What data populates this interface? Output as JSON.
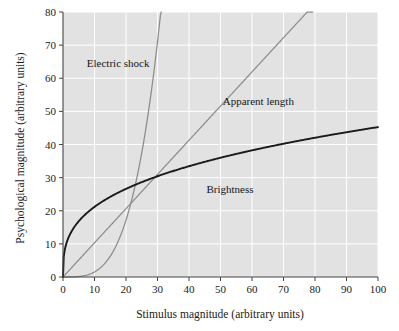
{
  "chart_data": {
    "type": "line",
    "title": "",
    "xlabel": "Stimulus magnitude (arbitrary units)",
    "ylabel": "Psychological magnitude (arbitrary units)",
    "xlim": [
      0,
      100
    ],
    "ylim": [
      0,
      80
    ],
    "xticks": [
      "0",
      "10",
      "20",
      "30",
      "40",
      "50",
      "60",
      "70",
      "80",
      "90",
      "100"
    ],
    "yticks": [
      "0",
      "10",
      "20",
      "30",
      "40",
      "50",
      "60",
      "70",
      "80"
    ],
    "grid": true,
    "legend_position": "inline-annotations",
    "plot_background": "#e2e2e2",
    "grid_color": "#ffffff",
    "series": [
      {
        "name": "Electric shock",
        "label": "Electric shock",
        "color": "#8c8c8c",
        "exponent": 3.5,
        "coefficient": 0.00048,
        "x": [
          0,
          5,
          10,
          15,
          20,
          25,
          30,
          32,
          34,
          35,
          36,
          38,
          40,
          41.5
        ],
        "values": [
          0,
          0.13,
          1.5,
          6.3,
          17.2,
          37.5,
          71.0,
          29.9,
          33.2,
          34.9,
          36.8,
          43.3,
          48.6,
          80.0
        ],
        "annotation": {
          "text": "Electric shock",
          "x": 17.5,
          "y": 63.5
        }
      },
      {
        "name": "Apparent length",
        "label": "Apparent length",
        "color": "#8c8c8c",
        "exponent": 1.0,
        "coefficient": 1.032,
        "x": [
          0,
          10,
          20,
          30,
          40,
          50,
          60,
          70,
          77.5
        ],
        "values": [
          0,
          10.3,
          20.6,
          31.0,
          41.3,
          51.6,
          61.9,
          72.3,
          80.0
        ],
        "annotation": {
          "text": "Apparent length",
          "x": 62,
          "y": 52
        }
      },
      {
        "name": "Brightness",
        "label": "Brightness",
        "color": "#1a1a1a",
        "exponent": 0.33,
        "coefficient": 9.9,
        "x": [
          0,
          1,
          2,
          5,
          10,
          15,
          20,
          30,
          40,
          50,
          60,
          70,
          80,
          90,
          100
        ],
        "values": [
          0,
          9.9,
          12.4,
          16.9,
          21.2,
          24.3,
          26.7,
          30.6,
          33.6,
          36.2,
          38.5,
          40.4,
          42.2,
          43.9,
          45.4
        ],
        "annotation": {
          "text": "Brightness",
          "x": 53,
          "y": 25.5
        }
      }
    ]
  }
}
